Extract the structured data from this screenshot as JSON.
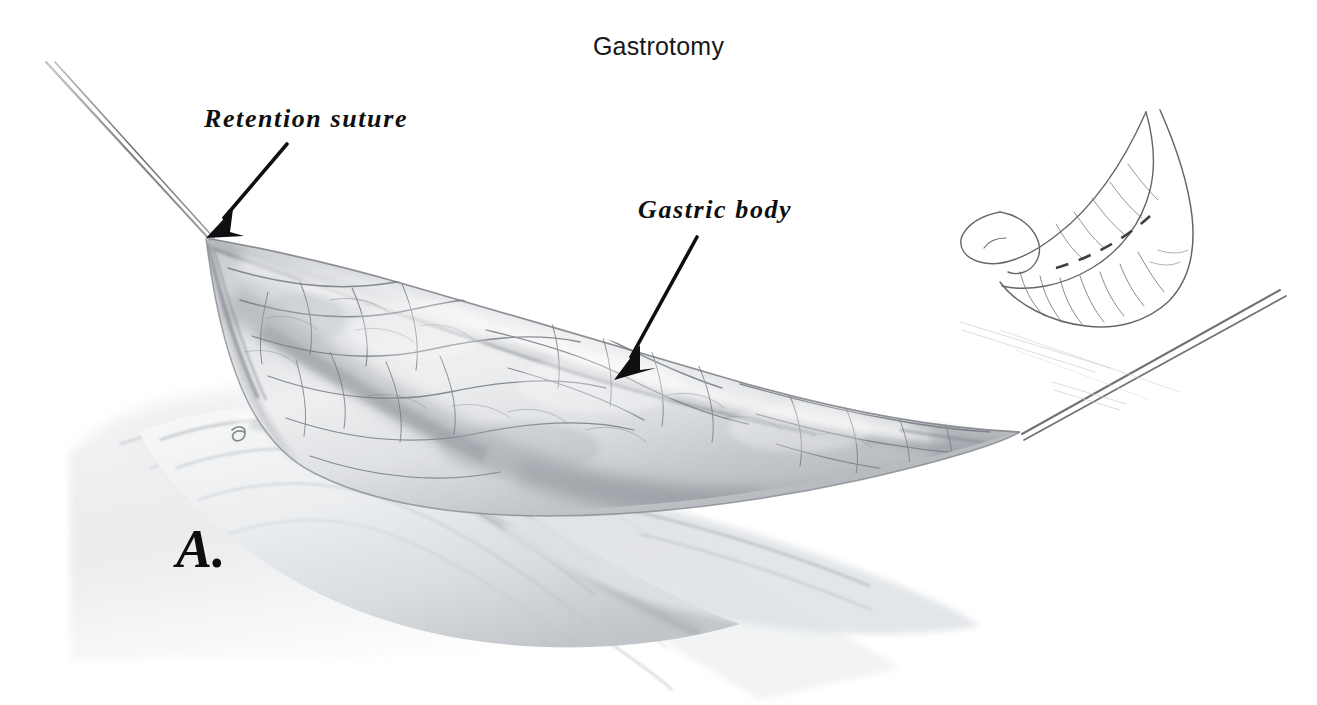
{
  "figure": {
    "title": "Gastrotomy",
    "panel_letter": "A.",
    "background_color": "#ffffff",
    "ink_color": "#0e0f11",
    "pencil_color": "#8d9095",
    "width": 1317,
    "height": 705
  },
  "labels": {
    "retention_suture": "Retention suture",
    "gastric_body": "Gastric body"
  },
  "annotations": {
    "leader_arrows": [
      {
        "name": "retention-suture-arrow",
        "target": "retention_suture",
        "tail": [
          287,
          144
        ],
        "tip": [
          206,
          238
        ],
        "color": "#0e0f11"
      },
      {
        "name": "gastric-body-arrow",
        "target": "gastric_body",
        "tail": [
          697,
          237
        ],
        "tip": [
          614,
          380
        ],
        "color": "#0e0f11"
      }
    ]
  },
  "illustration": {
    "subject": "tented anterior gastric wall held up by two retention sutures",
    "technique": "graphite pencil medical illustration",
    "elements": [
      "left-retention-suture-strand",
      "right-retention-suture-strand",
      "gastric-body-tented-wall",
      "serosal-vascular-network",
      "lower-gastric-fold",
      "surgical-drape-folds",
      "artist-mark",
      "orientation-inset-stomach"
    ]
  },
  "inset": {
    "name": "orientation-inset",
    "subject": "whole stomach with dashed incision line over the gastric body",
    "line_style": "dashed",
    "position": [
      960,
      100
    ],
    "size": [
      260,
      250
    ]
  }
}
